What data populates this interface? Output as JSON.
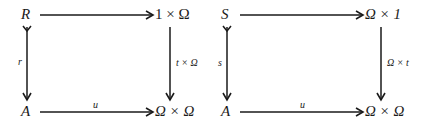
{
  "diagrams": [
    {
      "nodes": {
        "top_left": "R",
        "top_right": "1 × Ω",
        "bottom_left": "A",
        "bottom_right": "Ω × Ω"
      },
      "arrows": {
        "top": "",
        "left": "r",
        "right": "t × Ω",
        "bottom": "u"
      },
      "left_arrow_type": "monomorphism"
    },
    {
      "nodes": {
        "top_left": "S",
        "top_right": "Ω × 1",
        "bottom_left": "A",
        "bottom_right": "Ω × Ω"
      },
      "arrows": {
        "top": "",
        "left": "s",
        "right": "Ω × t",
        "bottom": "u"
      },
      "left_arrow_type": "monomorphism"
    }
  ]
}
